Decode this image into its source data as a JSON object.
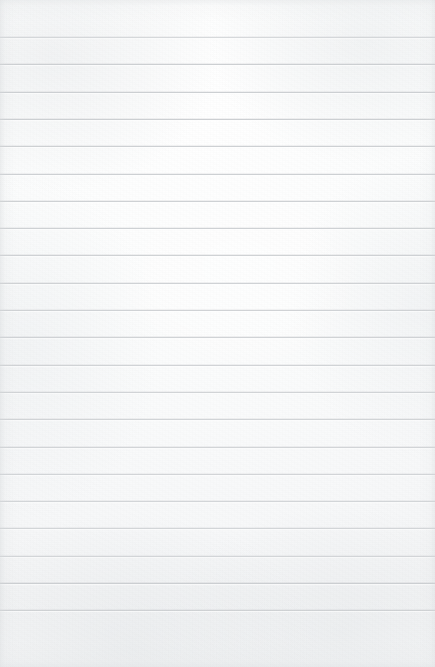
{
  "document": {
    "kind": "scanned-lined-paper",
    "title": "Blank lined notebook page",
    "visible_text": "",
    "handwriting": "none",
    "page_width_px": 435,
    "page_height_px": 667
  },
  "paper": {
    "background_color": "#fafbfb",
    "highlight_color": "#ffffff",
    "edge_shade_color": "#d6d9db",
    "texture": "fine paper grain with soft scan blotches"
  },
  "ruling": {
    "line_color": "#cbced1",
    "line_thickness_px": 1,
    "line_spacing_px": 27.3,
    "first_line_y_px": 37,
    "line_count": 22,
    "left_inset_px": 0,
    "right_inset_px": 0,
    "margin_line": "none",
    "line_y_positions": [
      37,
      64.3,
      91.6,
      118.9,
      146.2,
      173.5,
      200.8,
      228.1,
      255.4,
      282.7,
      310,
      337.3,
      364.6,
      391.9,
      419.2,
      446.5,
      473.8,
      501.1,
      528.4,
      555.7,
      583,
      610.3
    ]
  },
  "regions": {
    "top_margin_label": "blank top margin",
    "bottom_margin_label": "blank bottom margin",
    "writing_area_label": "ruled writing area"
  }
}
